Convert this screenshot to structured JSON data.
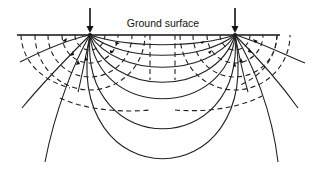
{
  "diagram": {
    "ground_label": "Ground surface",
    "colors": {
      "line": "#222222",
      "background": "#ffffff"
    },
    "electrodes": [
      {
        "name": "left-current-electrode",
        "x": 90,
        "y": 35
      },
      {
        "name": "right-current-electrode",
        "x": 235,
        "y": 35
      }
    ],
    "ground_surface": {
      "x1": 17,
      "x2": 280,
      "y": 35
    },
    "equipotential_radii": [
      15,
      28,
      42,
      55
    ],
    "legend": {
      "solid_lines": "current flow lines",
      "dashed_lines": "equipotential surfaces"
    }
  }
}
